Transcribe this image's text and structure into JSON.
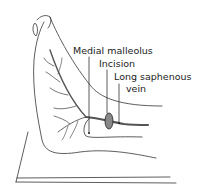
{
  "diagram": {
    "labels": {
      "medial_malleolus": "Medial malleolus",
      "incision": "Incision",
      "long_saphenous_line1": "Long saphenous",
      "long_saphenous_line2": "vein"
    },
    "colors": {
      "ink": "#222222",
      "vein": "#555555",
      "background": "#ffffff"
    }
  }
}
